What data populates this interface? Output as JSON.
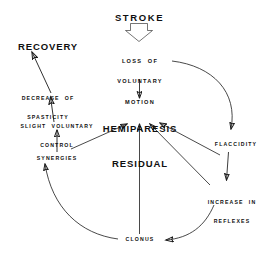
{
  "diagram": {
    "title": "STROKE",
    "background_color": "#ffffff",
    "ink_color": "#1a1a1a",
    "nodes": [
      {
        "id": "stroke",
        "label": "STROKE",
        "lines": [
          "STROKE"
        ]
      },
      {
        "id": "loss",
        "label": "LOSS OF VOLUNTARY MOTION",
        "lines": [
          "LOSS  OF",
          "VOLUNTARY",
          "MOTION"
        ]
      },
      {
        "id": "recovery",
        "label": "RECOVERY",
        "lines": [
          "RECOVERY"
        ]
      },
      {
        "id": "decrease",
        "label": "DECREASE OF SPASTICITY",
        "lines": [
          "DECREASE  OF",
          "SPASTICITY"
        ]
      },
      {
        "id": "slight",
        "label": "SLIGHT VOLUNTARY CONTROL",
        "lines": [
          "SLIGHT  VOLUNTARY",
          "CONTROL"
        ]
      },
      {
        "id": "hemiparesis",
        "label": "HEMIPARESIS RESIDUAL",
        "lines": [
          "HEMIPARESIS",
          "RESIDUAL"
        ]
      },
      {
        "id": "synergies",
        "label": "SYNERGIES",
        "lines": [
          "SYNERGIES"
        ]
      },
      {
        "id": "flaccidity",
        "label": "FLACCIDITY",
        "lines": [
          "FLACCIDITY"
        ]
      },
      {
        "id": "reflexes",
        "label": "INCREASE IN REFLEXES",
        "lines": [
          "INCREASE  IN",
          "REFLEXES"
        ]
      },
      {
        "id": "clonus",
        "label": "CLONUS",
        "lines": [
          "CLONUS"
        ]
      }
    ],
    "edges": [
      {
        "from": "stroke",
        "to": "loss",
        "style": "thick-block-arrow"
      },
      {
        "from": "loss",
        "to": "hemiparesis",
        "style": "straight"
      },
      {
        "from": "loss",
        "to": "flaccidity",
        "style": "curve"
      },
      {
        "from": "flaccidity",
        "to": "reflexes",
        "style": "straight"
      },
      {
        "from": "reflexes",
        "to": "clonus",
        "style": "curve"
      },
      {
        "from": "clonus",
        "to": "synergies",
        "style": "curve"
      },
      {
        "from": "synergies",
        "to": "hemiparesis",
        "style": "straight"
      },
      {
        "from": "clonus",
        "to": "hemiparesis",
        "style": "straight"
      },
      {
        "from": "reflexes",
        "to": "hemiparesis",
        "style": "straight"
      },
      {
        "from": "flaccidity",
        "to": "hemiparesis",
        "style": "straight"
      },
      {
        "from": "synergies",
        "to": "slight",
        "style": "straight"
      },
      {
        "from": "slight",
        "to": "decrease",
        "style": "straight"
      },
      {
        "from": "decrease",
        "to": "recovery",
        "style": "straight"
      }
    ]
  }
}
